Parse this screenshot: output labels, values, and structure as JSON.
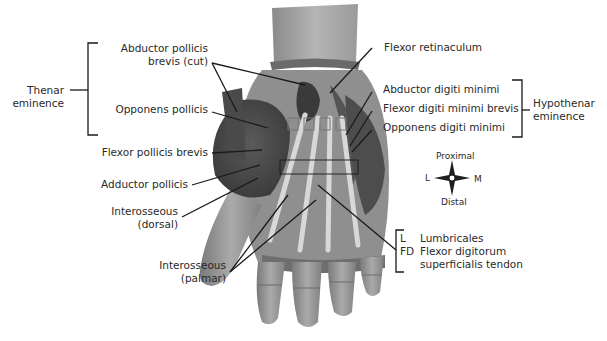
{
  "figure": {
    "groups": {
      "thenar": {
        "label_line1": "Thenar",
        "label_line2": "eminence"
      },
      "hypothenar": {
        "label_line1": "Hypothenar",
        "label_line2": "eminence"
      }
    },
    "labels_left": [
      {
        "line1": "Abductor pollicis",
        "line2": "brevis (cut)"
      },
      {
        "line1": "Opponens pollicis"
      },
      {
        "line1": "Flexor pollicis brevis"
      },
      {
        "line1": "Adductor pollicis"
      },
      {
        "line1": "Interosseous",
        "line2": "(dorsal)"
      },
      {
        "line1": "Interosseous",
        "line2": "(palmar)"
      }
    ],
    "labels_right": [
      {
        "line1": "Flexor retinaculum"
      },
      {
        "line1": "Abductor digiti minimi"
      },
      {
        "line1": "Flexor digiti minimi brevis"
      },
      {
        "line1": "Opponens digiti minimi"
      }
    ],
    "key": {
      "items": [
        {
          "abbr": "L",
          "text": "Lumbricales"
        },
        {
          "abbr": "FD",
          "text": "Flexor digitorum",
          "text2": "superficialis tendon"
        }
      ]
    },
    "compass": {
      "top": "Proximal",
      "bottom": "Distal",
      "left": "L",
      "right": "M"
    },
    "colors": {
      "background": "#ffffff",
      "text": "#2a2a2a",
      "lines": "#1a1a1a",
      "skin": "#9a9a9a",
      "muscle": "#4a4a4a"
    }
  }
}
